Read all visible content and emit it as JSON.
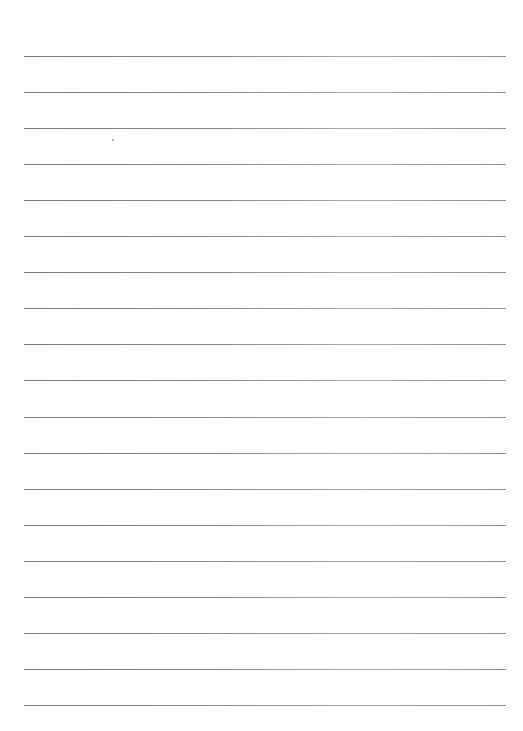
{
  "page": {
    "type": "lined-paper",
    "line_count": 19,
    "first_line_y": 56,
    "line_spacing": 36.05,
    "line_left": 24,
    "line_width": 482,
    "line_color": "#8a8a8a",
    "background": "#ffffff",
    "marks": [
      {
        "x": 112,
        "y": 139
      }
    ]
  }
}
